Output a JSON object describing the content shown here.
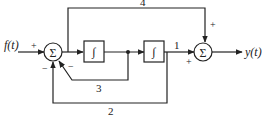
{
  "diagram": {
    "type": "block-diagram",
    "input_label": "f(t)",
    "output_label": "y(t)",
    "summing_symbol": "Σ",
    "integrator_symbol": "∫",
    "signs": {
      "sum1_input": "+",
      "sum1_feedback3": "−",
      "sum1_feedback2": "−",
      "sum2_top": "+",
      "sum2_left": "+"
    },
    "branch_labels": {
      "feedforward_top": "4",
      "after_integrator2": "1",
      "inner_feedback": "3",
      "outer_feedback": "2"
    },
    "colors": {
      "line": "#222222",
      "background": "#ffffff"
    }
  }
}
